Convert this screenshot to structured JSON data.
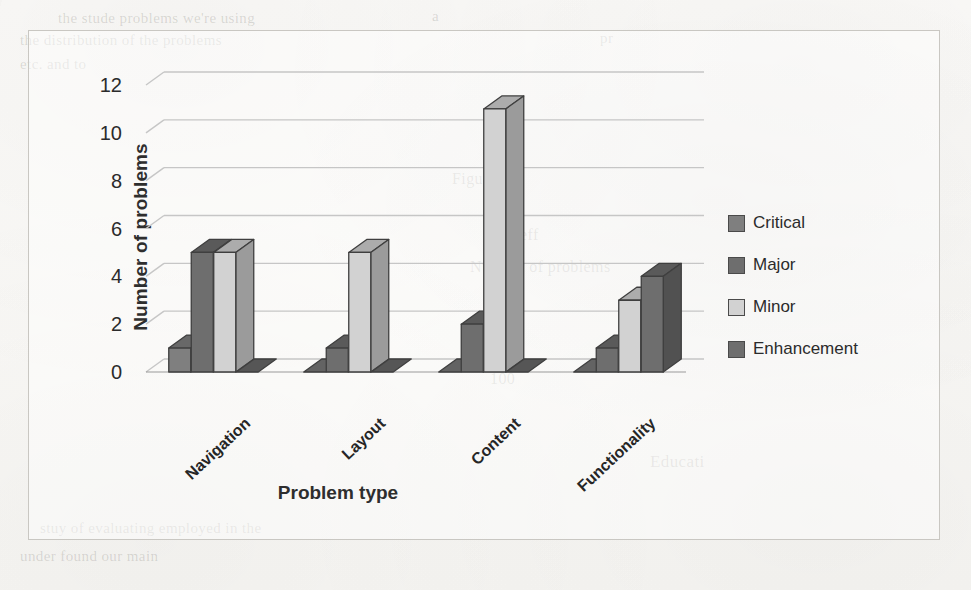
{
  "chart_data": {
    "type": "bar",
    "title": "",
    "subtitle": "",
    "xlabel": "Problem type",
    "ylabel": "Number of problems",
    "categories": [
      "Navigation",
      "Layout",
      "Content",
      "Functionality"
    ],
    "series": [
      {
        "name": "Critical",
        "values": [
          1,
          0,
          0,
          0
        ],
        "color": "#7f7f7f"
      },
      {
        "name": "Major",
        "values": [
          5,
          1,
          2,
          1
        ],
        "color": "#6e6e6e"
      },
      {
        "name": "Minor",
        "values": [
          5,
          5,
          11,
          3
        ],
        "color": "#d2d2d2"
      },
      {
        "name": "Enhancement",
        "values": [
          0,
          0,
          0,
          4
        ],
        "color": "#6e6e6e"
      }
    ],
    "ylim": [
      0,
      12
    ],
    "yticks": [
      0,
      2,
      4,
      6,
      8,
      10,
      12
    ],
    "ytick_labels": [
      "0",
      "2",
      "4",
      "6",
      "8",
      "10",
      "12"
    ],
    "grid": true,
    "grid_axis": "y",
    "legend_position": "right",
    "style": "3d-clustered-column",
    "xtick_rotation": -43
  },
  "legend": {
    "items": [
      {
        "label": "Critical",
        "color": "#7f7f7f"
      },
      {
        "label": "Major",
        "color": "#6e6e6e"
      },
      {
        "label": "Minor",
        "color": "#d2d2d2"
      },
      {
        "label": "Enhancement",
        "color": "#6e6e6e"
      }
    ]
  },
  "page_background_text": [
    {
      "text": "the stude problems we're using",
      "x": 58,
      "y": 10,
      "size": 15
    },
    {
      "text": "a",
      "x": 432,
      "y": 8,
      "size": 15
    },
    {
      "text": "the distribution of the problems",
      "x": 20,
      "y": 32,
      "size": 15
    },
    {
      "text": "pr",
      "x": 600,
      "y": 30,
      "size": 15
    },
    {
      "text": "etc. and to",
      "x": 20,
      "y": 56,
      "size": 15
    },
    {
      "text": "Figure",
      "x": 452,
      "y": 170,
      "size": 16
    },
    {
      "text": "Number of problems",
      "x": 470,
      "y": 258,
      "size": 16
    },
    {
      "text": "eff",
      "x": 520,
      "y": 226,
      "size": 16
    },
    {
      "text": "100",
      "x": 490,
      "y": 370,
      "size": 16
    },
    {
      "text": "Educati",
      "x": 650,
      "y": 452,
      "size": 17
    },
    {
      "text": "stuy of evaluating employed in the",
      "x": 40,
      "y": 520,
      "size": 15
    },
    {
      "text": "under found our main",
      "x": 20,
      "y": 548,
      "size": 15
    }
  ]
}
